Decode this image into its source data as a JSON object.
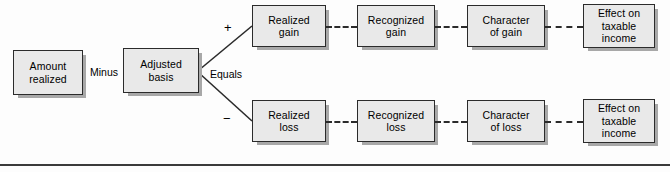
{
  "diagram": {
    "nodes": {
      "amount_realized": "Amount\nrealized",
      "adjusted_basis": "Adjusted\nbasis",
      "realized_gain": "Realized\ngain",
      "recognized_gain": "Recognized\ngain",
      "character_of_gain": "Character\nof gain",
      "effect_taxable_income_gain": "Effect on\ntaxable\nincome",
      "realized_loss": "Realized\nloss",
      "recognized_loss": "Recognized\nloss",
      "character_of_loss": "Character\nof loss",
      "effect_taxable_income_loss": "Effect on\ntaxable\nincome"
    },
    "operators": {
      "minus": "Minus",
      "equals": "Equals",
      "plus_sign": "+",
      "minus_sign": "−"
    },
    "colors": {
      "node_fill": "#e9e9e9",
      "node_border": "#2b2b2b",
      "node_shadow": "#a8a8a8",
      "connector": "#2b2b2b",
      "rule": "#3a3a3a",
      "background": "#fdfdfd"
    }
  }
}
